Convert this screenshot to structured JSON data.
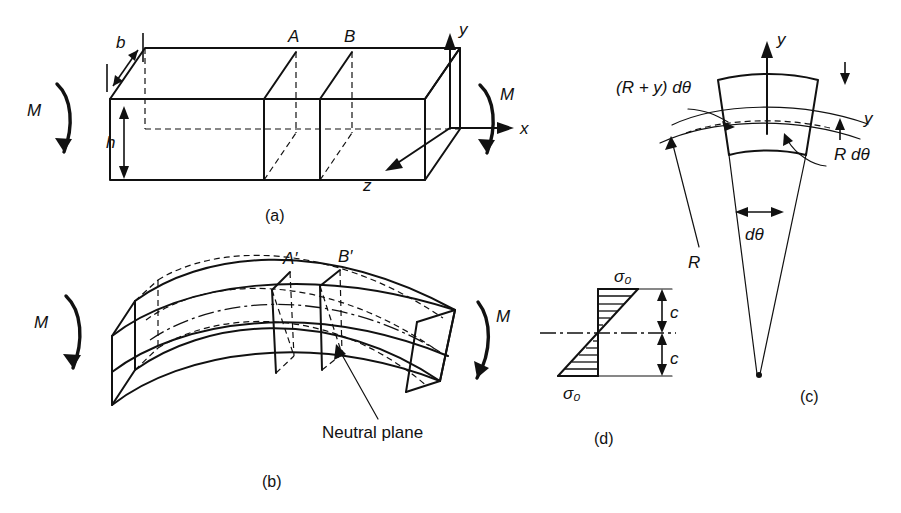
{
  "figure": {
    "background_color": "#ffffff",
    "line_color": "#111111"
  },
  "panels": [
    {
      "id": "a",
      "caption": "(a)",
      "description": "Straight rectangular beam in pure bending with cross-section planes A and B",
      "labels": {
        "moment_left": "M",
        "moment_right": "M",
        "width": "b",
        "height": "h",
        "section_a": "A",
        "section_b": "B",
        "axis_x": "x",
        "axis_y": "y",
        "axis_z": "z"
      }
    },
    {
      "id": "b",
      "caption": "(b)",
      "description": "Deformed (bent) beam showing rotated sections A-prime and B-prime and the neutral plane",
      "labels": {
        "moment_left": "M",
        "moment_right": "M",
        "section_a": "A′",
        "section_b": "B′",
        "neutral_plane": "Neutral plane"
      }
    },
    {
      "id": "c",
      "caption": "(c)",
      "description": "Geometry of a differential curved element subtending angle d-theta about radius R",
      "labels": {
        "arc_outer": "(R + y) dθ",
        "arc_neutral": "R dθ",
        "radius": "R",
        "angle": "dθ",
        "axis_y": "y",
        "offset_y": "y"
      }
    },
    {
      "id": "d",
      "caption": "(d)",
      "description": "Linear bending stress distribution over the cross-section depth",
      "labels": {
        "stress_top": "σ₀",
        "stress_bottom": "σ₀",
        "half_depth_top": "c",
        "half_depth_bottom": "c"
      }
    }
  ]
}
